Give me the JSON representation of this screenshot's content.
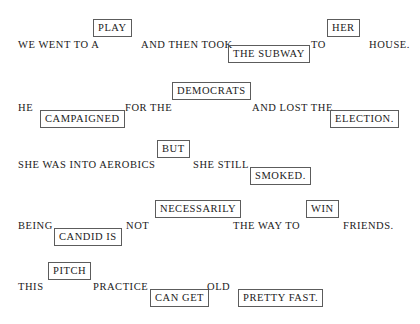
{
  "artwork": {
    "title": "Boxed Words Typographic Composition",
    "background_color": "#ffffff",
    "text_color": "#1a1a1a",
    "box_border_color": "#5c5c5c"
  },
  "lines": [
    {
      "id": "line-1",
      "sentence": "WE WENT TO A PLAY AND THEN TOOK THE SUBWAY TO HER HOUSE.",
      "segments": [
        {
          "text": "WE WENT TO A",
          "boxed": false,
          "x": 18,
          "y": 38,
          "shift": "none"
        },
        {
          "text": "PLAY",
          "boxed": true,
          "x": 93,
          "y": 19,
          "shift": "up"
        },
        {
          "text": "AND THEN TOOK",
          "boxed": false,
          "x": 141,
          "y": 38,
          "shift": "none"
        },
        {
          "text": "THE SUBWAY",
          "boxed": true,
          "x": 228,
          "y": 45,
          "shift": "down"
        },
        {
          "text": "TO",
          "boxed": false,
          "x": 311,
          "y": 38,
          "shift": "none"
        },
        {
          "text": "HER",
          "boxed": true,
          "x": 327,
          "y": 19,
          "shift": "up"
        },
        {
          "text": "HOUSE.",
          "boxed": false,
          "x": 369,
          "y": 38,
          "shift": "none"
        }
      ]
    },
    {
      "id": "line-2",
      "sentence": "HE CAMPAIGNED FOR THE DEMOCRATS AND LOST THE ELECTION.",
      "segments": [
        {
          "text": "HE",
          "boxed": false,
          "x": 18,
          "y": 101,
          "shift": "none"
        },
        {
          "text": "CAMPAIGNED",
          "boxed": true,
          "x": 40,
          "y": 110,
          "shift": "down"
        },
        {
          "text": "FOR THE",
          "boxed": false,
          "x": 125,
          "y": 101,
          "shift": "none"
        },
        {
          "text": "DEMOCRATS",
          "boxed": true,
          "x": 172,
          "y": 82,
          "shift": "up"
        },
        {
          "text": "AND LOST THE",
          "boxed": false,
          "x": 252,
          "y": 101,
          "shift": "none"
        },
        {
          "text": "ELECTION.",
          "boxed": true,
          "x": 330,
          "y": 110,
          "shift": "down"
        }
      ]
    },
    {
      "id": "line-3",
      "sentence": "SHE WAS INTO AEROBICS BUT SHE STILL SMOKED.",
      "segments": [
        {
          "text": "SHE WAS INTO AEROBICS",
          "boxed": false,
          "x": 18,
          "y": 158,
          "shift": "none"
        },
        {
          "text": "BUT",
          "boxed": true,
          "x": 157,
          "y": 140,
          "shift": "up"
        },
        {
          "text": "SHE STILL",
          "boxed": false,
          "x": 193,
          "y": 158,
          "shift": "none"
        },
        {
          "text": "SMOKED.",
          "boxed": true,
          "x": 250,
          "y": 167,
          "shift": "down"
        }
      ]
    },
    {
      "id": "line-4",
      "sentence": "BEING CANDID IS NOT NECESSARILY THE WAY TO WIN FRIENDS.",
      "segments": [
        {
          "text": "BEING",
          "boxed": false,
          "x": 18,
          "y": 219,
          "shift": "none"
        },
        {
          "text": "CANDID IS",
          "boxed": true,
          "x": 54,
          "y": 228,
          "shift": "down"
        },
        {
          "text": "NOT",
          "boxed": false,
          "x": 126,
          "y": 219,
          "shift": "none"
        },
        {
          "text": "NECESSARILY",
          "boxed": true,
          "x": 155,
          "y": 200,
          "shift": "up"
        },
        {
          "text": "THE WAY TO",
          "boxed": false,
          "x": 233,
          "y": 219,
          "shift": "none"
        },
        {
          "text": "WIN",
          "boxed": true,
          "x": 306,
          "y": 200,
          "shift": "up"
        },
        {
          "text": "FRIENDS.",
          "boxed": false,
          "x": 343,
          "y": 219,
          "shift": "none"
        }
      ]
    },
    {
      "id": "line-5",
      "sentence": "THIS PITCH PRACTICE CAN GET OLD PRETTY FAST.",
      "segments": [
        {
          "text": "THIS",
          "boxed": false,
          "x": 18,
          "y": 280,
          "shift": "none"
        },
        {
          "text": "PITCH",
          "boxed": true,
          "x": 48,
          "y": 262,
          "shift": "up"
        },
        {
          "text": "PRACTICE",
          "boxed": false,
          "x": 93,
          "y": 280,
          "shift": "none"
        },
        {
          "text": "CAN GET",
          "boxed": true,
          "x": 150,
          "y": 289,
          "shift": "down"
        },
        {
          "text": "OLD",
          "boxed": false,
          "x": 207,
          "y": 280,
          "shift": "none"
        },
        {
          "text": "PRETTY FAST.",
          "boxed": true,
          "x": 238,
          "y": 289,
          "shift": "down"
        }
      ]
    }
  ]
}
